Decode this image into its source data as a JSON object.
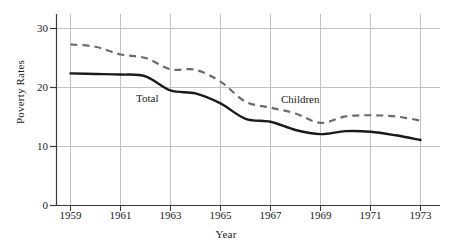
{
  "chart_data": {
    "type": "line",
    "title": "",
    "xlabel": "Year",
    "ylabel": "Poverty Rates",
    "x": [
      1959,
      1960,
      1961,
      1962,
      1963,
      1964,
      1965,
      1966,
      1967,
      1968,
      1969,
      1970,
      1971,
      1972,
      1973
    ],
    "xlim": [
      1958,
      1973
    ],
    "ylim": [
      0,
      32
    ],
    "xticks": [
      "1959",
      "1961",
      "1963",
      "1965",
      "1967",
      "1969",
      "1971",
      "1973"
    ],
    "yticks": [
      "0",
      "10",
      "20",
      "30"
    ],
    "grid": "both",
    "legend": "inline-labels",
    "series": [
      {
        "name": "Total",
        "style": "solid",
        "color": "#1a1a1a",
        "label_position": "inline",
        "values": [
          22.4,
          22.3,
          22.2,
          21.9,
          19.5,
          19.0,
          17.3,
          14.7,
          14.2,
          12.8,
          12.1,
          12.6,
          12.5,
          11.9,
          11.1
        ]
      },
      {
        "name": "Children",
        "style": "dashed",
        "color": "#666666",
        "label_position": "inline",
        "values": [
          27.3,
          26.9,
          25.6,
          25.0,
          23.1,
          23.0,
          21.0,
          17.6,
          16.6,
          15.6,
          14.0,
          15.1,
          15.3,
          15.1,
          14.4
        ]
      }
    ],
    "annotations": [
      {
        "text": "Total",
        "x": 1963.2,
        "y": 18.2
      },
      {
        "text": "Children",
        "x": 1967.2,
        "y": 17.3
      }
    ]
  },
  "axes": {
    "ytick_0": "0",
    "ytick_10": "10",
    "ytick_20": "20",
    "ytick_30": "30",
    "xtick_1959": "1959",
    "xtick_1961": "1961",
    "xtick_1963": "1963",
    "xtick_1965": "1965",
    "xtick_1967": "1967",
    "xtick_1969": "1969",
    "xtick_1971": "1971",
    "xtick_1973": "1973",
    "x_axis_title": "Year",
    "y_axis_title": "Poverty Rates"
  },
  "labels": {
    "total": "Total",
    "children": "Children"
  },
  "colors": {
    "total_line": "#1a1a1a",
    "children_line": "#6b6b6b",
    "grid": "#c8c8c8",
    "axis": "#3a3a3a",
    "background": "#ffffff"
  }
}
